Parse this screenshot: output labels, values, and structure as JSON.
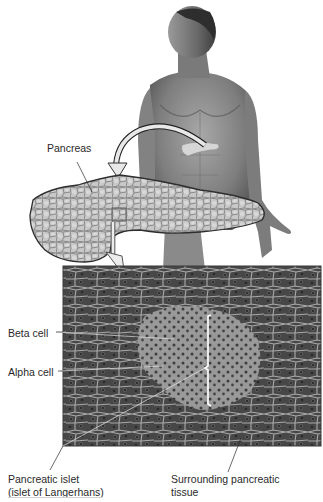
{
  "figure": {
    "labels": {
      "pancreas": "Pancreas",
      "beta_cell": "Beta cell",
      "alpha_cell": "Alpha cell",
      "islet_line1": "Pancreatic islet",
      "islet_line2": "(islet of Langerhans)",
      "surrounding_line1": "Surrounding pancreatic",
      "surrounding_line2": "tissue"
    },
    "panels": [
      {
        "name": "human-figure",
        "description": "Grayscale illustration of male torso with pancreas highlighted"
      },
      {
        "name": "pancreas-enlarged",
        "description": "Enlarged lobulated pancreas with small inset box"
      },
      {
        "name": "micrograph",
        "description": "Light micrograph of pancreatic tissue showing a pale islet among darker acinar tissue"
      }
    ],
    "colors": {
      "background": "#ffffff",
      "skin_mid": "#8c8c8c",
      "pancreas_fill": "#c9c9c9",
      "pancreas_outline": "#3a3a3a",
      "acinar_tissue": "#4a4a4a",
      "islet_tissue": "#9a9a9a",
      "septa": "#b5b5b5",
      "arrow_fill": "#e6e6e6",
      "label_text": "#2a2a2a"
    }
  }
}
